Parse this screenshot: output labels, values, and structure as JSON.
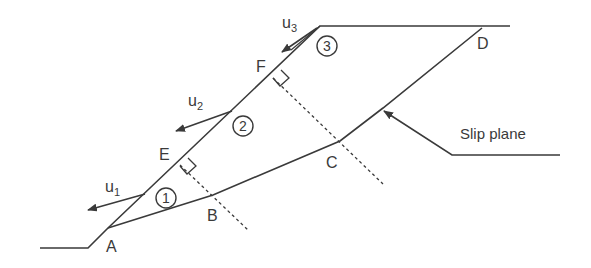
{
  "diagram": {
    "points": {
      "A": "A",
      "B": "B",
      "C": "C",
      "D": "D",
      "E": "E",
      "F": "F"
    },
    "wedges": {
      "w1": "1",
      "w2": "2",
      "w3": "3"
    },
    "forces": {
      "u1": {
        "base": "u",
        "sub": "1"
      },
      "u2": {
        "base": "u",
        "sub": "2"
      },
      "u3": {
        "base": "u",
        "sub": "3"
      }
    },
    "callout": "Slip plane",
    "colors": {
      "line": "#3a3a3a",
      "background": "#ffffff"
    }
  }
}
